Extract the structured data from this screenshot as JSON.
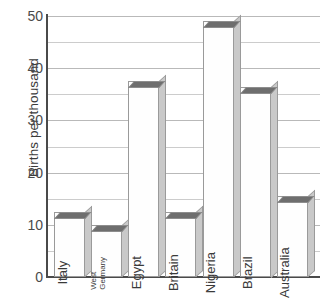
{
  "chart_data": {
    "type": "bar",
    "title": "",
    "xlabel": "",
    "ylabel": "Births per thousand",
    "ylim": [
      0,
      50
    ],
    "ytick_step": 10,
    "minor_gridline_step": 5,
    "grid": true,
    "legend": "none",
    "style": "3d-bars",
    "categories": [
      "Italy",
      "West Germany",
      "Egypt",
      "Britain",
      "Nigeria",
      "Brazil",
      "Australia"
    ],
    "values": [
      12.5,
      10,
      37.5,
      12.5,
      49,
      36.5,
      15.5
    ],
    "ytick_labels": [
      "0",
      "10",
      "20",
      "30",
      "40",
      "50"
    ],
    "ytick_values": [
      0,
      10,
      20,
      30,
      40,
      50
    ]
  },
  "axis": {
    "y_title": "Births per thousand"
  },
  "bars": [
    {
      "label": "Italy",
      "label_lines": [
        "Italy"
      ],
      "value": 12.5
    },
    {
      "label": "West Germany",
      "label_lines": [
        "West",
        "Germany"
      ],
      "value": 10
    },
    {
      "label": "Egypt",
      "label_lines": [
        "Egypt"
      ],
      "value": 37.5
    },
    {
      "label": "Britain",
      "label_lines": [
        "Britain"
      ],
      "value": 12.5
    },
    {
      "label": "Nigeria",
      "label_lines": [
        "Nigeria"
      ],
      "value": 49
    },
    {
      "label": "Brazil",
      "label_lines": [
        "Brazil"
      ],
      "value": 36.5
    },
    {
      "label": "Australia",
      "label_lines": [
        "Australia"
      ],
      "value": 15.5
    }
  ],
  "colors": {
    "bar_front": "#fefefe",
    "bar_top": "#6e6e6e",
    "bar_side": "#c9c9c9",
    "bar_outline": "#9a9a9a",
    "gridline_major": "#b9b9b9",
    "gridline_minor": "#cccccc",
    "axis": "#4a4a4a",
    "text": "#3b3b3b",
    "background": "#ffffff"
  }
}
